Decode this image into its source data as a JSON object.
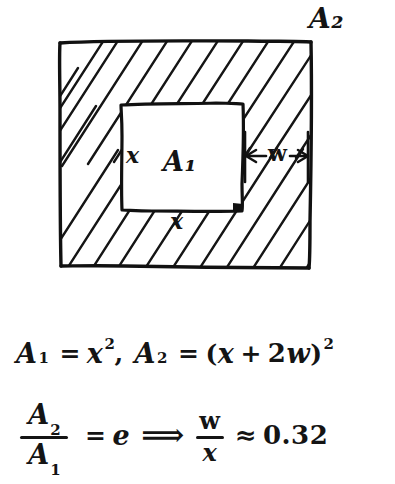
{
  "document": {
    "kind": "hand-drawn-math-diagram",
    "title": "Nested squares area diagram with border width w"
  },
  "figure": {
    "outer_region": {
      "name": "A2",
      "label": "A₂",
      "fill": "hatched",
      "hatch_direction": "lower-left-to-upper-right"
    },
    "inner_region": {
      "name": "A1",
      "label": "A₁",
      "fill": "blank"
    },
    "labels": {
      "outer_area": "A₂",
      "inner_area": "A₁",
      "side_left": "x",
      "side_bottom": "x",
      "border_width": "w"
    },
    "dimension_arrow": {
      "name": "w-dimension",
      "label": "w",
      "style": "double-headed"
    }
  },
  "equations": {
    "line1": {
      "A1_symbol": "A",
      "A1_sub": "1",
      "eq1": "=",
      "x_symbol": "x",
      "x_sup": "2",
      "comma": ",",
      "A2_symbol": "A",
      "A2_sub": "2",
      "eq2": "=",
      "open_paren": "(",
      "x2_symbol": "x",
      "plus": "+",
      "two": "2",
      "w_symbol": "w",
      "close_paren": ")",
      "paren_sup": "2",
      "plain": "A₁ = x² , A₂ = (x + 2w)²"
    },
    "line2": {
      "frac_num_symbol": "A",
      "frac_num_sub": "2",
      "frac_den_symbol": "A",
      "frac_den_sub": "1",
      "equals": "=",
      "e_symbol": "e",
      "implies": "⟹",
      "ratio_num": "w",
      "ratio_den": "x",
      "approx": "≈",
      "value": "0.32",
      "plain": "A₂ / A₁ = e ⟹ w/x ≈ 0.32"
    }
  },
  "colors": {
    "ink": "#141414",
    "paper": "#ffffff"
  }
}
